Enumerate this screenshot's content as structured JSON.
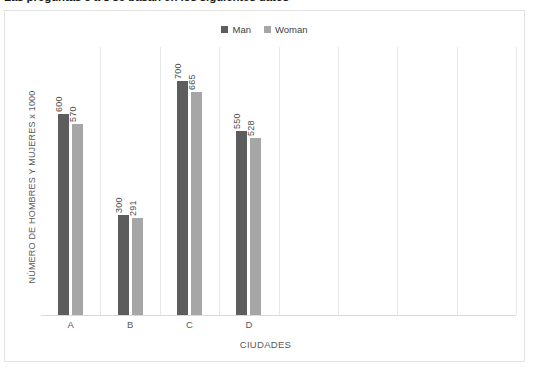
{
  "document": {
    "title": "Las preguntas 5 a 8 se basan en los siguientes datos"
  },
  "chart_data": {
    "type": "bar",
    "title": "",
    "xlabel": "CIUDADES",
    "ylabel": "NÚMERO DE HOMBRES Y MUJERES x 1000",
    "categories": [
      "A",
      "B",
      "C",
      "D"
    ],
    "series": [
      {
        "name": "Man",
        "color": "#5d5d5d",
        "values": [
          600,
          300,
          700,
          550
        ]
      },
      {
        "name": "Woman",
        "color": "#a6a6a6",
        "values": [
          570,
          291,
          665,
          528
        ]
      }
    ],
    "data_labels": {
      "A": {
        "Man": "600",
        "Woman": "570"
      },
      "B": {
        "Man": "300",
        "Woman": "291"
      },
      "C": {
        "Man": "700",
        "Woman": "665"
      },
      "D": {
        "Man": "550",
        "Woman": "528"
      }
    },
    "ylim": [
      0,
      800
    ],
    "grid": "vertical-only",
    "y_axis_ticks_visible": false,
    "legend_position": "top-center",
    "plot_background": "#ffffff",
    "gridline_color": "#e8e8e8",
    "axis_line_color": "#d9d9d9",
    "border_color": "#e2e2e2",
    "category_slots": 8,
    "note": "Four populated category slots followed by four empty slots on the right"
  },
  "legend": {
    "entries": [
      {
        "label": "Man",
        "color": "#5d5d5d"
      },
      {
        "label": "Woman",
        "color": "#a6a6a6"
      }
    ]
  },
  "axes": {
    "x": {
      "title": "CIUDADES",
      "ticks": [
        "A",
        "B",
        "C",
        "D"
      ]
    },
    "y": {
      "title": "NÚMERO DE HOMBRES Y MUJERES x 1000"
    }
  }
}
